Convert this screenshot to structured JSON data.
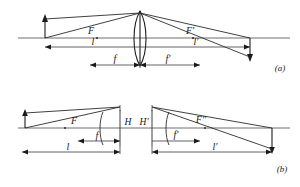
{
  "figure": {
    "type": "optics-ray-diagram",
    "panels": [
      {
        "id": "a",
        "panel_label": "(a)",
        "description": "Thin lens imaging: object arrow, biconvex lens, image arrow",
        "axis_y": 38,
        "labels": {
          "front_focal": "F",
          "rear_focal": "F'",
          "object_distance": "l",
          "image_distance": "l'",
          "front_focal_length": "f",
          "rear_focal_length": "f'"
        },
        "geometry": {
          "object_x": 45,
          "lens_x": 140,
          "image_x": 250,
          "front_focal_x": 97,
          "rear_focal_x": 193,
          "object_top_y": 18,
          "image_bottom_y": 60,
          "lens_top_y": 11,
          "lens_bottom_y": 66,
          "ray_apex_y": 13,
          "dim_l_y": 47,
          "dim_f_y": 65
        }
      },
      {
        "id": "b",
        "panel_label": "(b)",
        "description": "Thick lens imaging with principal planes H and H'",
        "axis_y": 128,
        "labels": {
          "front_focal": "F",
          "rear_focal": "F''",
          "principal_plane_front": "H",
          "principal_plane_rear": "H'",
          "object_distance": "l",
          "image_distance": "l'",
          "front_focal_length": "f",
          "rear_focal_length": "f'"
        },
        "geometry": {
          "object_x": 25,
          "principal_h_x": 120,
          "principal_hp_x": 152,
          "image_x": 272,
          "front_focal_x": 65,
          "rear_focal_x": 205,
          "front_surface_x": 101,
          "rear_surface_x": 167,
          "object_top_y": 112,
          "image_bottom_y": 153,
          "plane_top_y": 110,
          "plane_bottom_y": 146,
          "dim_f_y": 141,
          "dim_l_y": 152
        }
      }
    ],
    "colors": {
      "ray": "#2b2b2b",
      "axis": "#4a4a4a",
      "dimension": "#3a3a3a",
      "lens": "#1c1c1c",
      "text": "#1a1a1a",
      "background": "#ffffff"
    }
  }
}
